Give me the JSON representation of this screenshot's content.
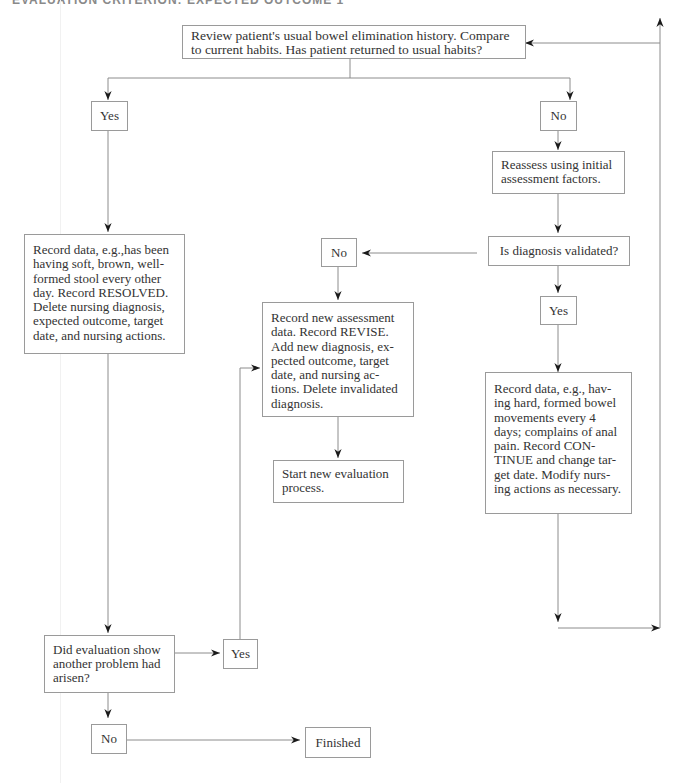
{
  "header": {
    "title": "EVALUATION CRITERION: EXPECTED OUTCOME 1"
  },
  "nodes": {
    "review": {
      "text": "Review patient's usual bowel elimination history. Compare to current habits. Has patient returned to usual habits?"
    },
    "yes_top": {
      "text": "Yes"
    },
    "no_top": {
      "text": "No"
    },
    "reassess": {
      "text": "Reassess using initial assessment factors."
    },
    "validated": {
      "text": "Is diagnosis validated?"
    },
    "no_mid": {
      "text": "No"
    },
    "yes_mid": {
      "text": "Yes"
    },
    "resolved": {
      "text": "Record data, e.g.,has been having soft, brown, well-formed stool every other day. Record RESOLVED. Delete nursing diagnosis, expected outcome, target date, and nursing actions."
    },
    "revise": {
      "text": "Record new assessment data. Record REVISE. Add new diagnosis, ex-pected outcome, target date, and nursing ac-tions. Delete invalidated diagnosis."
    },
    "start_new": {
      "text": "Start new evaluation process."
    },
    "continue": {
      "text": "Record data, e.g., hav-ing hard, formed bowel movements every 4 days; complains of anal pain. Record CON-TINUE and change tar-get date. Modify nurs-ing actions as necessary."
    },
    "another_problem": {
      "text": "Did evaluation show another problem had arisen?"
    },
    "yes_bottom": {
      "text": "Yes"
    },
    "no_bottom": {
      "text": "No"
    },
    "finished": {
      "text": "Finished"
    }
  },
  "colors": {
    "line": "#8c8c8c",
    "arrow": "#1a1a1a",
    "border": "#9a9a9a",
    "text": "#333333"
  }
}
